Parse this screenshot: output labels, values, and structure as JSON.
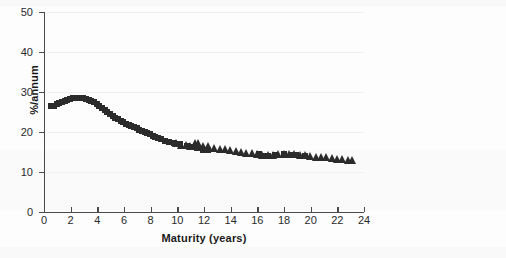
{
  "figure": {
    "background_color": "#fdfdfd",
    "marker_color": "#2b2b2b",
    "axis_color": "#4a4a4a",
    "grid_color": "#f0f0f0"
  },
  "chart_data": {
    "type": "scatter",
    "title": "",
    "subtitle": "",
    "xlabel": "Maturity (years)",
    "ylabel": "%/annum",
    "xlim": [
      0,
      24
    ],
    "ylim": [
      0,
      50
    ],
    "xticks": [
      0,
      2,
      4,
      6,
      8,
      10,
      12,
      14,
      16,
      18,
      20,
      22,
      24
    ],
    "yticks": [
      0,
      10,
      20,
      30,
      40,
      50
    ],
    "xtick_labels": [
      "0",
      "2",
      "4",
      "6",
      "8",
      "10",
      "12",
      "14",
      "16",
      "18",
      "20",
      "22",
      "24"
    ],
    "ytick_labels": [
      "0",
      "10",
      "20",
      "30",
      "40",
      "50"
    ],
    "grid": "horizontal-faint",
    "legend": "none",
    "legend_position": "none",
    "annotations": [],
    "series": [
      {
        "name": "squares",
        "marker": "square",
        "color": "#2b2b2b",
        "points": [
          [
            0.55,
            26.5
          ],
          [
            0.75,
            26.6
          ],
          [
            0.95,
            26.9
          ],
          [
            1.15,
            27.2
          ],
          [
            1.35,
            27.5
          ],
          [
            1.55,
            27.8
          ],
          [
            1.75,
            28.0
          ],
          [
            1.95,
            28.2
          ],
          [
            2.15,
            28.4
          ],
          [
            2.35,
            28.5
          ],
          [
            2.55,
            28.5
          ],
          [
            2.75,
            28.5
          ],
          [
            2.95,
            28.4
          ],
          [
            3.15,
            28.3
          ],
          [
            3.35,
            28.1
          ],
          [
            3.55,
            27.8
          ],
          [
            3.75,
            27.4
          ],
          [
            3.95,
            27.0
          ],
          [
            4.15,
            26.5
          ],
          [
            4.35,
            26.0
          ],
          [
            4.55,
            25.5
          ],
          [
            4.75,
            25.0
          ],
          [
            4.95,
            24.5
          ],
          [
            5.15,
            24.0
          ],
          [
            5.35,
            23.6
          ],
          [
            5.55,
            23.2
          ],
          [
            5.75,
            22.8
          ],
          [
            5.95,
            22.4
          ],
          [
            6.15,
            22.1
          ],
          [
            6.35,
            21.8
          ],
          [
            6.55,
            21.5
          ],
          [
            6.75,
            21.2
          ],
          [
            6.95,
            20.9
          ],
          [
            7.15,
            20.6
          ],
          [
            7.35,
            20.3
          ],
          [
            7.55,
            20.0
          ],
          [
            7.75,
            19.7
          ],
          [
            7.95,
            19.4
          ],
          [
            8.15,
            19.1
          ],
          [
            8.35,
            18.8
          ],
          [
            8.55,
            18.5
          ],
          [
            8.75,
            18.2
          ],
          [
            9.05,
            17.8
          ],
          [
            9.35,
            17.5
          ],
          [
            9.75,
            17.3
          ],
          [
            10.2,
            17.0
          ],
          [
            10.7,
            16.6
          ],
          [
            11.1,
            16.3
          ],
          [
            11.5,
            16.0
          ],
          [
            11.9,
            15.6
          ],
          [
            12.3,
            15.4
          ],
          [
            16.1,
            14.4
          ],
          [
            16.4,
            14.1
          ],
          [
            16.8,
            14.0
          ],
          [
            17.3,
            14.2
          ],
          [
            18.0,
            14.4
          ],
          [
            18.5,
            14.3
          ],
          [
            18.9,
            14.2
          ],
          [
            19.6,
            14.0
          ]
        ]
      },
      {
        "name": "triangles",
        "marker": "triangle",
        "color": "#2b2b2b",
        "points": [
          [
            9.9,
            16.9
          ],
          [
            10.3,
            16.6
          ],
          [
            10.7,
            16.4
          ],
          [
            11.0,
            16.2
          ],
          [
            11.35,
            17.0
          ],
          [
            11.6,
            16.9
          ],
          [
            11.95,
            16.3
          ],
          [
            12.35,
            16.2
          ],
          [
            12.8,
            15.7
          ],
          [
            13.2,
            15.5
          ],
          [
            13.6,
            15.4
          ],
          [
            14.0,
            15.2
          ],
          [
            14.4,
            15.0
          ],
          [
            14.8,
            14.8
          ],
          [
            15.2,
            14.6
          ],
          [
            15.6,
            14.4
          ],
          [
            16.0,
            14.3
          ],
          [
            16.4,
            14.1
          ],
          [
            16.8,
            14.0
          ],
          [
            17.2,
            14.1
          ],
          [
            17.6,
            14.2
          ],
          [
            18.0,
            14.3
          ],
          [
            18.4,
            14.3
          ],
          [
            18.8,
            14.2
          ],
          [
            19.2,
            14.1
          ],
          [
            19.6,
            14.0
          ],
          [
            20.0,
            13.8
          ],
          [
            20.4,
            13.6
          ],
          [
            20.8,
            13.5
          ],
          [
            21.2,
            13.4
          ],
          [
            21.6,
            13.2
          ],
          [
            22.0,
            13.1
          ],
          [
            22.4,
            13.0
          ],
          [
            22.8,
            12.8
          ],
          [
            23.1,
            12.7
          ]
        ]
      }
    ]
  }
}
